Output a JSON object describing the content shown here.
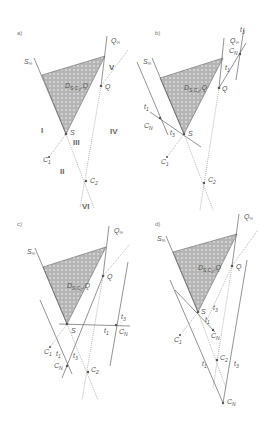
{
  "figure": {
    "panels": [
      {
        "id": "a",
        "label": "a)",
        "region_label": "D_{S,C2,Q}",
        "points": {
          "S": "S",
          "Q": "Q",
          "S_inf": "S∞",
          "Q_inf": "Q∞",
          "C1": "C1",
          "C2": "C2"
        },
        "regions": [
          "I",
          "II",
          "III",
          "IV",
          "V",
          "VI"
        ]
      },
      {
        "id": "b",
        "label": "b)",
        "region_label": "D_{S,C2,Q}",
        "points": {
          "S": "S",
          "Q": "Q",
          "S_inf": "S∞",
          "Q_inf": "Q∞",
          "C1": "C1",
          "C2": "C2",
          "CN_left": "CN",
          "CN_right": "CN"
        },
        "tangents": [
          "t1",
          "t3",
          "t1",
          "t3"
        ]
      },
      {
        "id": "c",
        "label": "c)",
        "region_label": "D_{S,C2,Q}",
        "points": {
          "S": "S",
          "Q": "Q",
          "S_inf": "S∞",
          "Q_inf": "Q∞",
          "C1": "C1",
          "C2": "C2",
          "CN_right": "CN",
          "CN_bottom": "CN"
        },
        "tangents": [
          "t1",
          "t3",
          "t1",
          "t3"
        ]
      },
      {
        "id": "d",
        "label": "d)",
        "region_label": "D_{S,C2,Q}",
        "points": {
          "S": "S",
          "Q": "Q",
          "S_inf": "S∞",
          "Q_inf": "Q∞",
          "C1": "C1",
          "C2": "C2",
          "CN_upper": "CN",
          "CN_lower": "CN"
        },
        "tangents": [
          "t1",
          "t3",
          "t1",
          "t3"
        ]
      }
    ],
    "labels": {
      "a": "a)",
      "b": "b)",
      "c": "c)",
      "d": "d)",
      "S": "S",
      "Q": "Q",
      "Sinf": "S",
      "Qinf": "Q",
      "inf": "∞",
      "C": "C",
      "sub1": "1",
      "sub2": "2",
      "subN": "N",
      "D": "D",
      "Dsub": "S,C",
      "Dsub2": "2",
      "Dtail": ",Q",
      "t": "t",
      "I": "I",
      "II": "II",
      "III": "III",
      "IV": "IV",
      "V": "V",
      "VI": "VI"
    },
    "colors": {
      "region_fill": "#b8b8b8",
      "line": "#666666",
      "text": "#555555"
    }
  }
}
